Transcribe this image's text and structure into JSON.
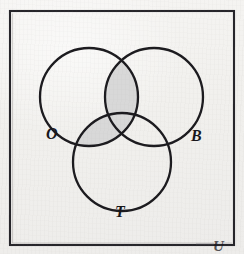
{
  "figure": {
    "kind": "venn-diagram",
    "set_count": 3,
    "universe_label": "U",
    "background_color": "#f1f0ed",
    "stroke_color": "#1b1a1e",
    "shade_color": "#d8d8d8"
  },
  "universe": {
    "name": "universal-set-rectangle",
    "label": "U",
    "x": 10,
    "y": 11,
    "width": 224,
    "height": 234,
    "stroke_width": 2
  },
  "circles": [
    {
      "id": "O",
      "label": "O",
      "cx": 89,
      "cy": 97,
      "r": 49,
      "stroke_width": 2.2
    },
    {
      "id": "B",
      "label": "B",
      "cx": 154,
      "cy": 97,
      "r": 49,
      "stroke_width": 2.2
    },
    {
      "id": "T",
      "label": "T",
      "cx": 122,
      "cy": 162,
      "r": 49,
      "stroke_width": 2.2
    }
  ],
  "labels": [
    {
      "id": "O",
      "text": "O",
      "x": 53,
      "y": 134
    },
    {
      "id": "B",
      "text": "B",
      "x": 198,
      "y": 136
    },
    {
      "id": "T",
      "text": "T",
      "x": 122,
      "y": 212
    },
    {
      "id": "U",
      "text": "U",
      "x": 220,
      "y": 246
    }
  ],
  "regions": [
    {
      "id": "O-only",
      "sets": [
        "O"
      ],
      "shaded": false
    },
    {
      "id": "B-only",
      "sets": [
        "B"
      ],
      "shaded": false
    },
    {
      "id": "T-only",
      "sets": [
        "T"
      ],
      "shaded": false
    },
    {
      "id": "O-and-B",
      "sets": [
        "O",
        "B"
      ],
      "shaded": true
    },
    {
      "id": "O-and-T",
      "sets": [
        "O",
        "T"
      ],
      "shaded": true
    },
    {
      "id": "B-and-T",
      "sets": [
        "B",
        "T"
      ],
      "shaded": false
    },
    {
      "id": "O-and-B-and-T",
      "sets": [
        "O",
        "B",
        "T"
      ],
      "shaded": true
    },
    {
      "id": "outside",
      "sets": [],
      "shaded": false
    }
  ],
  "shaded_description": "O intersect (B union T)"
}
